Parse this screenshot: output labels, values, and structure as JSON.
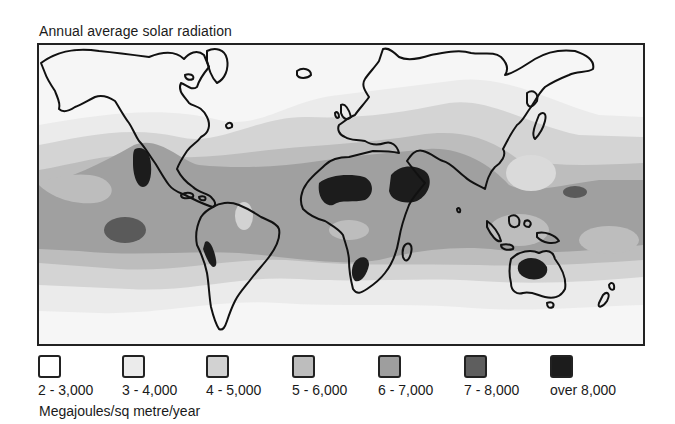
{
  "title": "Annual average solar radiation",
  "units": "Megajoules/sq metre/year",
  "legend": [
    {
      "label": "2 - 3,000",
      "color": "#ffffff"
    },
    {
      "label": "3 - 4,000",
      "color": "#ebebeb"
    },
    {
      "label": "4 - 5,000",
      "color": "#d2d2d2"
    },
    {
      "label": "5 - 6,000",
      "color": "#bdbdbd"
    },
    {
      "label": "6 - 7,000",
      "color": "#9e9e9e"
    },
    {
      "label": "7 - 8,000",
      "color": "#5e5e5e"
    },
    {
      "label": "over 8,000",
      "color": "#1c1c1c"
    }
  ],
  "colors": {
    "outline": "#111111",
    "frame": "#222222"
  }
}
